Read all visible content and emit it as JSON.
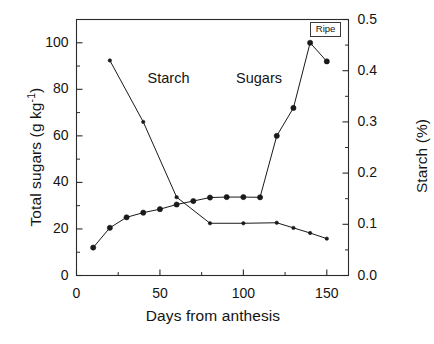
{
  "chart_data": {
    "type": "line",
    "title": "",
    "xlabel": "Days from anthesis",
    "ylabel": "Total sugars (g kg-1)",
    "ylabel_prefix": "Total sugars (g kg",
    "ylabel_sup": "-1",
    "ylabel_suffix": ")",
    "y2label": "Starch (%)",
    "xlim": [
      0,
      163
    ],
    "ylim": [
      0,
      110
    ],
    "y2lim": [
      0.0,
      0.5
    ],
    "grid": false,
    "legend_position": "inline-annotations",
    "xticks": [
      0,
      50,
      100,
      150
    ],
    "xticklabels": [
      "0",
      "50",
      "100",
      "150"
    ],
    "xminorticks": [
      25,
      75,
      125
    ],
    "yticks": [
      0,
      20,
      40,
      60,
      80,
      100
    ],
    "yticklabels": [
      "0",
      "20",
      "40",
      "60",
      "80",
      "100"
    ],
    "yminorticks": [
      10,
      30,
      50,
      70,
      90,
      110
    ],
    "y2ticks": [
      0.0,
      0.1,
      0.2,
      0.3,
      0.4,
      0.5
    ],
    "y2ticklabels": [
      "0.0",
      "0.1",
      "0.2",
      "0.3",
      "0.4",
      "0.5"
    ],
    "y2minorticks": [
      0.05,
      0.15,
      0.25,
      0.35,
      0.45
    ],
    "annotations": [
      {
        "text": "Starch",
        "x": 57,
        "y": 84,
        "axis": "left"
      },
      {
        "text": "Sugars",
        "x": 110,
        "y": 84,
        "axis": "left"
      },
      {
        "text": "Ripe",
        "x": 150,
        "y": 108,
        "axis": "left",
        "boxed": true
      }
    ],
    "series": [
      {
        "name": "Sugars",
        "axis": "left",
        "units": "g kg-1",
        "marker": "filled-circle",
        "color": "#1a1a1a",
        "x": [
          10,
          20,
          30,
          40,
          50,
          60,
          70,
          80,
          90,
          100,
          110,
          120,
          130,
          140,
          150
        ],
        "values": [
          12.0,
          20.5,
          25.0,
          27.0,
          28.5,
          30.5,
          32.0,
          33.5,
          33.7,
          33.7,
          33.6,
          60.0,
          72.0,
          100.0,
          92.0
        ]
      },
      {
        "name": "Starch",
        "axis": "right",
        "units": "%",
        "marker": "small-dot",
        "color": "#1a1a1a",
        "x": [
          20,
          40,
          60,
          80,
          100,
          120,
          130,
          140,
          150
        ],
        "values": [
          0.42,
          0.3,
          0.153,
          0.102,
          0.102,
          0.103,
          0.093,
          0.083,
          0.072
        ]
      }
    ]
  }
}
